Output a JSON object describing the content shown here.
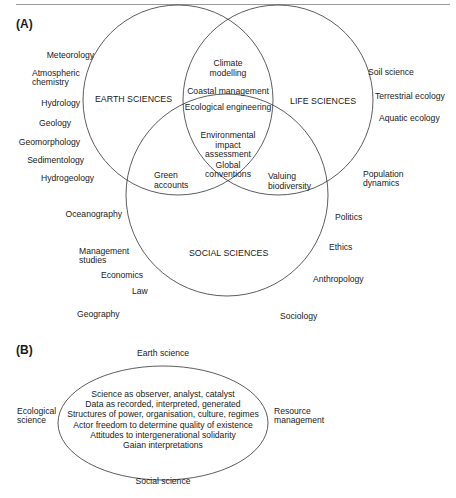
{
  "panel_a": {
    "label": "(A)",
    "circles": {
      "earth": "EARTH SCIENCES",
      "life": "LIFE SCIENCES",
      "social": "SOCIAL SCIENCES"
    },
    "overlaps": {
      "earth_life": [
        "Climate",
        "modelling",
        "Coastal management",
        "Ecological engineering"
      ],
      "all_three": [
        "Environmental",
        "impact",
        "assessment",
        "Global",
        "conventions"
      ],
      "earth_social": [
        "Green",
        "accounts"
      ],
      "life_social": [
        "Valuing",
        "biodiversity"
      ]
    },
    "earth_disciplines": [
      "Meteorology",
      "Atmospheric",
      "chemistry",
      "Hydrology",
      "Geology",
      "Geomorphology",
      "Sedimentology",
      "Hydrogeology",
      "Oceanography"
    ],
    "life_disciplines": [
      "Soil science",
      "Terrestrial ecology",
      "Aquatic ecology",
      "Population",
      "dynamics"
    ],
    "social_disciplines": [
      "Management",
      "studies",
      "Economics",
      "Law",
      "Geography",
      "Politics",
      "Ethics",
      "Anthropology",
      "Sociology"
    ]
  },
  "panel_b": {
    "label": "(B)",
    "top": "Earth science",
    "bottom": "Social science",
    "left": [
      "Ecological",
      "science"
    ],
    "right": [
      "Resource",
      "management"
    ],
    "ellipse_lines": [
      "Science as observer, analyst, catalyst",
      "Data as recorded, interpreted, generated",
      "Structures of power, organisation, culture, regimes",
      "Actor freedom to determine quality of existence",
      "Attitudes to intergenerational solidarity",
      "Gaian interpretations"
    ]
  }
}
